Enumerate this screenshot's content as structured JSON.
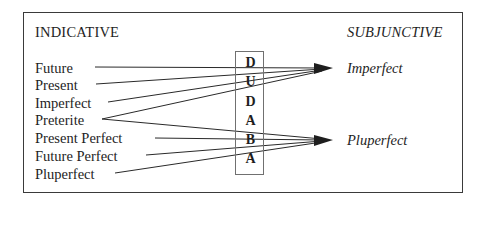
{
  "diagram": {
    "left_header": "INDICATIVE",
    "right_header": "SUBJUNCTIVE",
    "indicative_tenses": [
      {
        "label": "Future",
        "y": 67,
        "line_start_x": 95
      },
      {
        "label": "Present",
        "y": 84,
        "line_start_x": 96
      },
      {
        "label": "Imperfect",
        "y": 102,
        "line_start_x": 108
      },
      {
        "label": "Preterite",
        "y": 119,
        "line_start_x": 102
      },
      {
        "label": "Present Perfect",
        "y": 138,
        "line_start_x": 155
      },
      {
        "label": "Future Perfect",
        "y": 155,
        "line_start_x": 146
      },
      {
        "label": "Pluperfect",
        "y": 173,
        "line_start_x": 115
      }
    ],
    "mnemonic_letters": [
      "D",
      "U",
      "D",
      "A",
      "B",
      "A"
    ],
    "subjunctive_targets": [
      {
        "label": "Imperfect",
        "arrow_tip": [
          332,
          68
        ],
        "y": 67
      },
      {
        "label": "Pluperfect",
        "arrow_tip": [
          332,
          140
        ],
        "y": 139
      }
    ],
    "connections": [
      {
        "from": "Future",
        "to": "Imperfect"
      },
      {
        "from": "Present",
        "to": "Imperfect"
      },
      {
        "from": "Imperfect",
        "to": "Imperfect"
      },
      {
        "from": "Preterite",
        "to": "Imperfect"
      },
      {
        "from": "Preterite",
        "to": "Pluperfect"
      },
      {
        "from": "Present Perfect",
        "to": "Pluperfect"
      },
      {
        "from": "Future Perfect",
        "to": "Pluperfect"
      },
      {
        "from": "Pluperfect",
        "to": "Pluperfect"
      }
    ],
    "colors": {
      "line": "#2a2a2a",
      "frame": "#3a3a3a",
      "text": "#1e1e1e"
    }
  }
}
